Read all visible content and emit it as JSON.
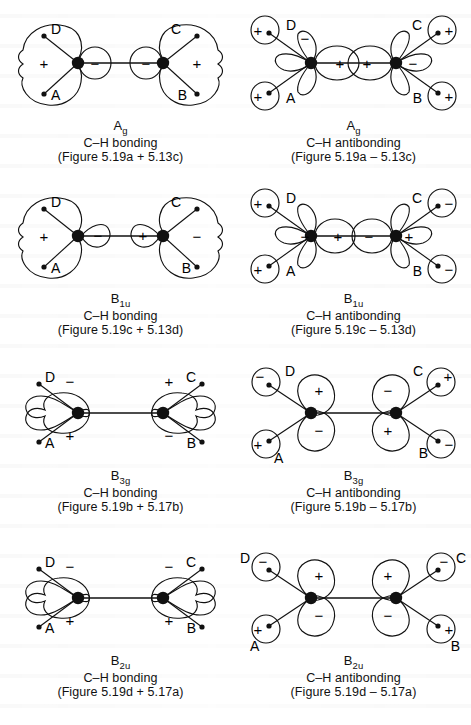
{
  "document": {
    "type": "molecular-orbital-diagram-set",
    "subject": "Symmetry-adapted C–H group orbitals of ethylene",
    "background_color": "#ffffff",
    "ink_color": "#111111"
  },
  "panels": [
    {
      "id": "ag-bonding",
      "row": 1,
      "column": "left",
      "symmetry_label": "A",
      "symmetry_sub": "g",
      "bond_label": "C–H bonding",
      "source_label": "(Figure 5.19a + 5.13c)",
      "layout": "sigma",
      "hydrogens": [
        {
          "name": "D",
          "position": "upper-left",
          "sign": null
        },
        {
          "name": "A",
          "position": "lower-left",
          "sign": null
        },
        {
          "name": "C",
          "position": "upper-right",
          "sign": null
        },
        {
          "name": "B",
          "position": "lower-right",
          "sign": null
        }
      ],
      "carbon_lobes": [
        {
          "side": "left",
          "lobe": "outer",
          "sign": "+"
        },
        {
          "side": "left",
          "lobe": "inner",
          "sign": "−"
        },
        {
          "side": "right",
          "lobe": "inner",
          "sign": "−"
        },
        {
          "side": "right",
          "lobe": "outer",
          "sign": "+"
        }
      ],
      "h_circles": false
    },
    {
      "id": "ag-antibonding",
      "row": 1,
      "column": "right",
      "symmetry_label": "A",
      "symmetry_sub": "g",
      "bond_label": "C–H antibonding",
      "source_label": "(Figure 5.19a – 5.13c)",
      "layout": "sigma-star",
      "hydrogens": [
        {
          "name": "D",
          "position": "upper-left",
          "sign": "+"
        },
        {
          "name": "A",
          "position": "lower-left",
          "sign": "+"
        },
        {
          "name": "C",
          "position": "upper-right",
          "sign": "+"
        },
        {
          "name": "B",
          "position": "lower-right",
          "sign": "+"
        }
      ],
      "carbon_lobes": [
        {
          "side": "left",
          "lobe": "outer",
          "sign": "−"
        },
        {
          "side": "left",
          "lobe": "inner",
          "sign": "+"
        },
        {
          "side": "right",
          "lobe": "inner",
          "sign": "+"
        },
        {
          "side": "right",
          "lobe": "outer",
          "sign": "−"
        }
      ],
      "h_circles": true
    },
    {
      "id": "b1u-bonding",
      "row": 2,
      "column": "left",
      "symmetry_label": "B",
      "symmetry_sub": "1u",
      "bond_label": "C–H bonding",
      "source_label": "(Figure 5.19c + 5.13d)",
      "layout": "sigma",
      "hydrogens": [
        {
          "name": "D",
          "position": "upper-left",
          "sign": null
        },
        {
          "name": "A",
          "position": "lower-left",
          "sign": null
        },
        {
          "name": "C",
          "position": "upper-right",
          "sign": null
        },
        {
          "name": "B",
          "position": "lower-right",
          "sign": null
        }
      ],
      "carbon_lobes": [
        {
          "side": "left",
          "lobe": "outer",
          "sign": "+"
        },
        {
          "side": "left",
          "lobe": "inner",
          "sign": "−"
        },
        {
          "side": "right",
          "lobe": "inner",
          "sign": "+"
        },
        {
          "side": "right",
          "lobe": "outer",
          "sign": "−"
        }
      ],
      "h_circles": false
    },
    {
      "id": "b1u-antibonding",
      "row": 2,
      "column": "right",
      "symmetry_label": "B",
      "symmetry_sub": "1u",
      "bond_label": "C–H antibonding",
      "source_label": "(Figure 5.19c – 5.13d)",
      "layout": "sigma-star",
      "hydrogens": [
        {
          "name": "D",
          "position": "upper-left",
          "sign": "+"
        },
        {
          "name": "A",
          "position": "lower-left",
          "sign": "+"
        },
        {
          "name": "C",
          "position": "upper-right",
          "sign": "−"
        },
        {
          "name": "B",
          "position": "lower-right",
          "sign": "−"
        }
      ],
      "carbon_lobes": [
        {
          "side": "left",
          "lobe": "outer",
          "sign": "−"
        },
        {
          "side": "left",
          "lobe": "inner",
          "sign": "+"
        },
        {
          "side": "right",
          "lobe": "inner",
          "sign": "−"
        },
        {
          "side": "right",
          "lobe": "outer",
          "sign": "+"
        }
      ],
      "h_circles": true
    },
    {
      "id": "b3g-bonding",
      "row": 3,
      "column": "left",
      "symmetry_label": "B",
      "symmetry_sub": "3g",
      "bond_label": "C–H bonding",
      "source_label": "(Figure 5.19b + 5.17b)",
      "layout": "pi",
      "hydrogens": [
        {
          "name": "D",
          "position": "upper-left",
          "sign": null
        },
        {
          "name": "A",
          "position": "lower-left",
          "sign": null
        },
        {
          "name": "C",
          "position": "upper-right",
          "sign": null
        },
        {
          "name": "B",
          "position": "lower-right",
          "sign": null
        }
      ],
      "carbon_lobes": [
        {
          "side": "left",
          "lobe": "upper",
          "sign": "−"
        },
        {
          "side": "left",
          "lobe": "lower",
          "sign": "+"
        },
        {
          "side": "right",
          "lobe": "upper",
          "sign": "+"
        },
        {
          "side": "right",
          "lobe": "lower",
          "sign": "−"
        }
      ],
      "h_circles": false
    },
    {
      "id": "b3g-antibonding",
      "row": 3,
      "column": "right",
      "symmetry_label": "B",
      "symmetry_sub": "3g",
      "bond_label": "C–H antibonding",
      "source_label": "(Figure 5.19b – 5.17b)",
      "layout": "pi",
      "hydrogens": [
        {
          "name": "D",
          "position": "upper-left",
          "sign": "−"
        },
        {
          "name": "A",
          "position": "lower-left",
          "sign": "+"
        },
        {
          "name": "C",
          "position": "upper-right",
          "sign": "+"
        },
        {
          "name": "B",
          "position": "lower-right",
          "sign": "−"
        }
      ],
      "carbon_lobes": [
        {
          "side": "left",
          "lobe": "upper",
          "sign": "+"
        },
        {
          "side": "left",
          "lobe": "lower",
          "sign": "−"
        },
        {
          "side": "right",
          "lobe": "upper",
          "sign": "−"
        },
        {
          "side": "right",
          "lobe": "lower",
          "sign": "+"
        }
      ],
      "h_circles": true
    },
    {
      "id": "b2u-bonding",
      "row": 4,
      "column": "left",
      "symmetry_label": "B",
      "symmetry_sub": "2u",
      "bond_label": "C–H bonding",
      "source_label": "(Figure 5.19d + 5.17a)",
      "layout": "pi",
      "hydrogens": [
        {
          "name": "D",
          "position": "upper-left",
          "sign": null
        },
        {
          "name": "A",
          "position": "lower-left",
          "sign": null
        },
        {
          "name": "C",
          "position": "upper-right",
          "sign": null
        },
        {
          "name": "B",
          "position": "lower-right",
          "sign": null
        }
      ],
      "carbon_lobes": [
        {
          "side": "left",
          "lobe": "upper",
          "sign": "−"
        },
        {
          "side": "left",
          "lobe": "lower",
          "sign": "+"
        },
        {
          "side": "right",
          "lobe": "upper",
          "sign": "−"
        },
        {
          "side": "right",
          "lobe": "lower",
          "sign": "+"
        }
      ],
      "h_circles": false
    },
    {
      "id": "b2u-antibonding",
      "row": 4,
      "column": "right",
      "symmetry_label": "B",
      "symmetry_sub": "2u",
      "bond_label": "C–H antibonding",
      "source_label": "(Figure 5.19d – 5.17a)",
      "layout": "pi",
      "hydrogens": [
        {
          "name": "D",
          "position": "upper-left",
          "sign": "−"
        },
        {
          "name": "A",
          "position": "lower-left",
          "sign": "+"
        },
        {
          "name": "C",
          "position": "upper-right",
          "sign": "−"
        },
        {
          "name": "B",
          "position": "lower-right",
          "sign": "+"
        }
      ],
      "carbon_lobes": [
        {
          "side": "left",
          "lobe": "upper",
          "sign": "+"
        },
        {
          "side": "left",
          "lobe": "lower",
          "sign": "−"
        },
        {
          "side": "right",
          "lobe": "upper",
          "sign": "+"
        },
        {
          "side": "right",
          "lobe": "lower",
          "sign": "−"
        }
      ],
      "h_circles": true
    }
  ]
}
